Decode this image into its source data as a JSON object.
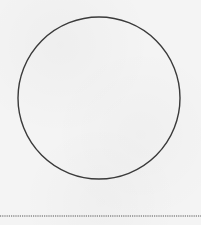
{
  "diagram": {
    "background_color": "#f4f4f4",
    "shapes": [
      {
        "type": "circle",
        "name": "large-circle",
        "cx": 99,
        "cy": 98,
        "r": 81,
        "stroke": "#3a3a3a",
        "stroke_width": 1.4,
        "fill": "none"
      },
      {
        "type": "dotted-line",
        "name": "bottom-dotted-line",
        "x1": 0,
        "y1": 216,
        "x2": 201,
        "y2": 216,
        "stroke": "#555555",
        "dash": "1.2 1"
      }
    ]
  }
}
